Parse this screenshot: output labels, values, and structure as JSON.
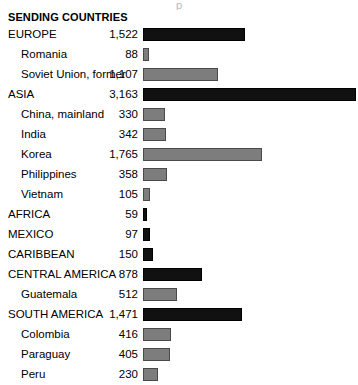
{
  "heading": "SENDING COUNTRIES",
  "title_remnant": "p",
  "colors": {
    "region_bar": "#111111",
    "country_bar": "#7d7d7d",
    "country_bar_outline": "#4a4a4a",
    "background": "#ffffff",
    "text": "#000000"
  },
  "chart_data": {
    "type": "bar",
    "orientation": "horizontal",
    "title": "SENDING COUNTRIES",
    "xlabel": "",
    "ylabel": "",
    "xlim": [
      0,
      3163
    ],
    "grid": false,
    "legend": null,
    "categories": [
      "EUROPE",
      "Romania",
      "Soviet Union, former",
      "ASIA",
      "China, mainland",
      "India",
      "Korea",
      "Philippines",
      "Vietnam",
      "AFRICA",
      "MEXICO",
      "CARIBBEAN",
      "CENTRAL AMERICA",
      "Guatemala",
      "SOUTH AMERICA",
      "Colombia",
      "Paraguay",
      "Peru"
    ],
    "values": [
      1522,
      88,
      1107,
      3163,
      330,
      342,
      1765,
      358,
      105,
      59,
      97,
      150,
      878,
      512,
      1471,
      416,
      405,
      230
    ],
    "value_labels": [
      "1,522",
      "88",
      "1,107",
      "3,163",
      "330",
      "342",
      "1,765",
      "358",
      "105",
      "59",
      "97",
      "150",
      "878",
      "512",
      "1,471",
      "416",
      "405",
      "230"
    ],
    "levels": [
      "region",
      "country",
      "country",
      "region",
      "country",
      "country",
      "country",
      "country",
      "country",
      "region",
      "region",
      "region",
      "region",
      "country",
      "region",
      "country",
      "country",
      "country"
    ]
  },
  "rows": [
    {
      "label": "EUROPE",
      "value": "1,522",
      "amount": 1522,
      "level": "region"
    },
    {
      "label": "Romania",
      "value": "88",
      "amount": 88,
      "level": "country"
    },
    {
      "label": "Soviet Union, former",
      "value": "1,107",
      "amount": 1107,
      "level": "country"
    },
    {
      "label": "ASIA",
      "value": "3,163",
      "amount": 3163,
      "level": "region"
    },
    {
      "label": "China, mainland",
      "value": "330",
      "amount": 330,
      "level": "country"
    },
    {
      "label": "India",
      "value": "342",
      "amount": 342,
      "level": "country"
    },
    {
      "label": "Korea",
      "value": "1,765",
      "amount": 1765,
      "level": "country"
    },
    {
      "label": "Philippines",
      "value": "358",
      "amount": 358,
      "level": "country"
    },
    {
      "label": "Vietnam",
      "value": "105",
      "amount": 105,
      "level": "country"
    },
    {
      "label": "AFRICA",
      "value": "59",
      "amount": 59,
      "level": "region"
    },
    {
      "label": "MEXICO",
      "value": "97",
      "amount": 97,
      "level": "region"
    },
    {
      "label": "CARIBBEAN",
      "value": "150",
      "amount": 150,
      "level": "region"
    },
    {
      "label": "CENTRAL AMERICA",
      "value": "878",
      "amount": 878,
      "level": "region"
    },
    {
      "label": "Guatemala",
      "value": "512",
      "amount": 512,
      "level": "country"
    },
    {
      "label": "SOUTH AMERICA",
      "value": "1,471",
      "amount": 1471,
      "level": "region"
    },
    {
      "label": "Colombia",
      "value": "416",
      "amount": 416,
      "level": "country"
    },
    {
      "label": "Paraguay",
      "value": "405",
      "amount": 405,
      "level": "country"
    },
    {
      "label": "Peru",
      "value": "230",
      "amount": 230,
      "level": "country"
    }
  ]
}
